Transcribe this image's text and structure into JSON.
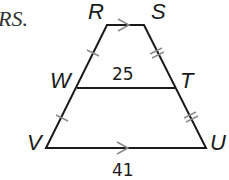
{
  "caption_fragment": "RS.",
  "figure": {
    "type": "trapezoid-midsegment",
    "vertices": {
      "R": "R",
      "S": "S",
      "W": "W",
      "T": "T",
      "V": "V",
      "U": "U"
    },
    "midsegment_length": "25",
    "base_length": "41",
    "parallel_sides": [
      "RS",
      "VU"
    ],
    "single_tick_segments": [
      "RW",
      "WV"
    ],
    "double_tick_segments": [
      "ST",
      "TU"
    ]
  },
  "colors": {
    "line": "#1a1a1a",
    "marks": "#8a8a8a"
  }
}
